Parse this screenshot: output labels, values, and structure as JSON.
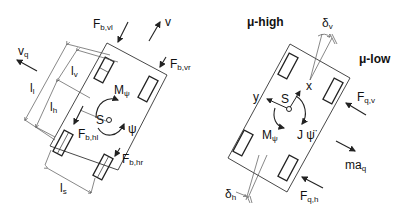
{
  "left_diagram": {
    "labels": {
      "F": "F",
      "F_b_vl_sub": "b,vl",
      "v": "v",
      "F_b_vr_sub": "b,vr",
      "v_q": "v",
      "v_q_sub": "q",
      "l_l": "l",
      "l_l_sub": "l",
      "l_v": "l",
      "l_v_sub": "v",
      "l_h": "l",
      "l_h_sub": "h",
      "M_psi": "M",
      "M_psi_sub": "ψ",
      "S": "S",
      "psi": "ψ",
      "F_b_hl_sub": "b,hl",
      "F_b_hr_sub": "b,hr",
      "l_s": "l",
      "l_s_sub": "s"
    }
  },
  "right_diagram": {
    "labels": {
      "mu_high": "μ-high",
      "mu_low": "μ-low",
      "delta_v": "δ",
      "delta_v_sub": "v",
      "x": "x",
      "y": "y",
      "S": "S",
      "F_q_v": "F",
      "F_q_v_sub": "q,v",
      "M_psi": "M",
      "M_psi_sub": "ψ",
      "J_psi_dd": "J ψ̈",
      "ma_q": "ma",
      "ma_q_sub": "q",
      "delta_h": "δ",
      "delta_h_sub": "h",
      "F_q_h": "F",
      "F_q_h_sub": "q,h"
    }
  },
  "colors": {
    "line": "#222222",
    "background": "#ffffff"
  }
}
